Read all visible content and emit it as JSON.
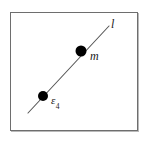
{
  "figure": {
    "kind": "geometry-diagram",
    "frame": {
      "border_color": "#6e6e6e",
      "background_color": "#ffffff",
      "shadow_color": "#b9b9b9"
    },
    "line": {
      "name": "l",
      "label": "l",
      "color": "#555555",
      "x1": 28,
      "y1": 113,
      "x2": 109,
      "y2": 26
    },
    "points": [
      {
        "id": "point-epsilon",
        "label": "ε",
        "subscript": "4",
        "color": "#000000",
        "cx": 43,
        "cy": 96,
        "r": 5
      },
      {
        "id": "point-m",
        "label": "m",
        "subscript": "",
        "color": "#000000",
        "cx": 81,
        "cy": 51,
        "r": 5.5
      }
    ]
  }
}
